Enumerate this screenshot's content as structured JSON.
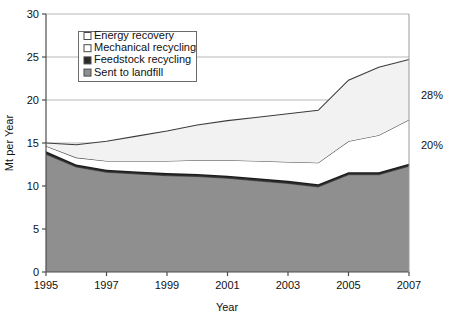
{
  "chart_data": {
    "type": "area",
    "stacked": true,
    "title": "",
    "xlabel": "Year",
    "ylabel": "Mt per Year",
    "xlim": [
      1995,
      2007
    ],
    "ylim": [
      0,
      30
    ],
    "ytick_step": 5,
    "xtick_step": 2,
    "grid": true,
    "grid_axis": "y",
    "legend_position": "upper-left-inside",
    "x": [
      1995,
      1996,
      1997,
      1998,
      1999,
      2000,
      2001,
      2002,
      2003,
      2004,
      2005,
      2006,
      2007
    ],
    "xtick_labels": [
      "1995",
      "1997",
      "1999",
      "2001",
      "2003",
      "2005",
      "2007"
    ],
    "ytick_labels": [
      "0",
      "5",
      "10",
      "15",
      "20",
      "25",
      "30"
    ],
    "series": [
      {
        "name": "Sent to landfill",
        "order": 1,
        "fill": "#8f8f8f",
        "stroke": "#555555",
        "marker": "filled-gray",
        "values": [
          13.7,
          12.2,
          11.6,
          11.4,
          11.2,
          11.1,
          10.9,
          10.6,
          10.3,
          9.9,
          11.3,
          11.3,
          12.3
        ]
      },
      {
        "name": "Feedstock recycling",
        "order": 2,
        "fill": "#2b2b2b",
        "stroke": "#1a1a1a",
        "marker": "filled-black",
        "values": [
          0.35,
          0.3,
          0.3,
          0.3,
          0.3,
          0.3,
          0.3,
          0.3,
          0.3,
          0.3,
          0.3,
          0.3,
          0.3
        ]
      },
      {
        "name": "Mechanical recycling",
        "order": 3,
        "fill": "#ffffff",
        "stroke": "#4a4a4a",
        "marker": "empty",
        "values": [
          0.6,
          0.8,
          1.0,
          1.2,
          1.4,
          1.6,
          1.8,
          2.0,
          2.2,
          2.5,
          3.6,
          4.3,
          5.1
        ]
      },
      {
        "name": "Energy recovery",
        "order": 4,
        "fill": "#f2f2f2",
        "stroke": "#3c3c3c",
        "marker": "empty",
        "values": [
          0.35,
          1.5,
          2.3,
          2.9,
          3.5,
          4.1,
          4.6,
          5.1,
          5.6,
          6.1,
          7.1,
          7.9,
          7.0
        ]
      }
    ],
    "cumulative_top": [
      15.0,
      14.8,
      15.2,
      15.8,
      16.4,
      17.1,
      17.6,
      18.0,
      18.4,
      18.8,
      22.3,
      23.8,
      24.7
    ],
    "annotations": [
      {
        "text": "28%",
        "x": 2007.4,
        "y": 20.6,
        "note": "share label at right of plot, upper"
      },
      {
        "text": "20%",
        "x": 2007.4,
        "y": 14.8,
        "note": "share label at right of plot, lower"
      }
    ],
    "legend_entries": [
      {
        "label": "Energy recovery",
        "marker": "empty"
      },
      {
        "label": "Mechanical recycling",
        "marker": "empty"
      },
      {
        "label": "Feedstock recycling",
        "marker": "filled-black"
      },
      {
        "label": "Sent to landfill",
        "marker": "filled-gray"
      }
    ]
  },
  "colors": {
    "landfill": "#8f8f8f",
    "feedstock": "#2b2b2b",
    "mechanical": "#ffffff",
    "energy": "#f2f2f2",
    "axis": "#4d4d4d",
    "grid": "#b8b8b8",
    "text": "#111111"
  }
}
